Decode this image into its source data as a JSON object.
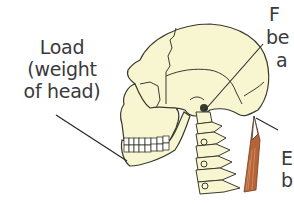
{
  "figure": {
    "labels": {
      "load": {
        "lines": [
          "Load",
          "(weight",
          "of head)"
        ]
      },
      "fulcrum": {
        "lines": [
          "F",
          "be",
          "a"
        ]
      },
      "effort": {
        "lines": [
          "E",
          "b"
        ]
      }
    },
    "colors": {
      "bone_fill": "#f7f6d0",
      "outline": "#3a3a30",
      "muscle": "#b5643a",
      "label_text": "#3a3a3a",
      "leader_line": "#2a2a2a"
    }
  }
}
